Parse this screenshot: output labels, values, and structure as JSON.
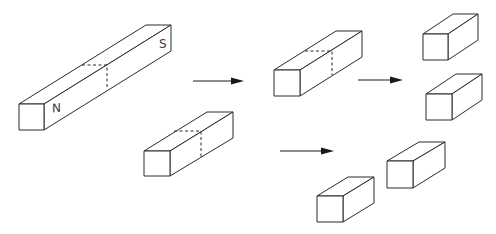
{
  "diagram": {
    "colors": {
      "line": "#2a2a2a",
      "background": "#ffffff",
      "arrow": "#1a1a1a"
    },
    "labels": {
      "north": "N",
      "south": "S"
    },
    "bars": [
      {
        "id": "original-magnet",
        "front": [
          19,
          104,
          25,
          26
        ],
        "back_top_right": [
          171,
          25
        ],
        "cut": {
          "top_x1": 82,
          "top_x2": 107,
          "top_y": 65,
          "bottom_y": 89
        },
        "poles": [
          "N",
          "S"
        ]
      },
      {
        "id": "half-magnet-top",
        "front": [
          274,
          70,
          26,
          26
        ],
        "back_top_right": [
          362,
          31
        ],
        "cut": {
          "top_x1": 305,
          "top_x2": 332,
          "top_y": 51,
          "bottom_y": 75
        }
      },
      {
        "id": "half-magnet-bottom",
        "front": [
          144,
          151,
          26,
          25
        ],
        "back_top_right": [
          233,
          112
        ],
        "cut": {
          "top_x1": 174,
          "top_x2": 201,
          "top_y": 131,
          "bottom_y": 157
        }
      },
      {
        "id": "quarter-a",
        "front": [
          423,
          34,
          25,
          26
        ],
        "back_top_right": [
          478,
          14
        ]
      },
      {
        "id": "quarter-b",
        "front": [
          426,
          94,
          26,
          26
        ],
        "back_top_right": [
          482,
          74
        ]
      },
      {
        "id": "quarter-c",
        "front": [
          387,
          161,
          26,
          27
        ],
        "back_top_right": [
          445,
          142
        ]
      },
      {
        "id": "quarter-d",
        "front": [
          317,
          196,
          26,
          26
        ],
        "back_top_right": [
          374,
          177
        ]
      }
    ],
    "arrows": [
      {
        "id": "arrow-1",
        "x1": 193,
        "x2": 243,
        "y": 81
      },
      {
        "id": "arrow-2",
        "x1": 358,
        "x2": 402,
        "y": 80
      },
      {
        "id": "arrow-3",
        "x1": 280,
        "x2": 333,
        "y": 151
      }
    ]
  }
}
